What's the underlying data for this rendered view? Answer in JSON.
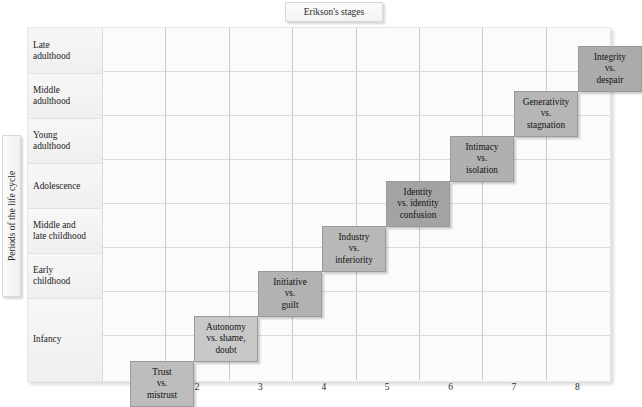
{
  "title": {
    "label": "Erikson's stages"
  },
  "y_axis": {
    "label": "Periods of the life cycle"
  },
  "rows": [
    {
      "id": "late-adulthood",
      "label": "Late\nadulthood",
      "top": 1,
      "height": 45
    },
    {
      "id": "middle-adulthood",
      "label": "Middle\nadulthood",
      "top": 46,
      "height": 45
    },
    {
      "id": "young-adulthood",
      "label": "Young\nadulthood",
      "top": 91,
      "height": 45
    },
    {
      "id": "adolescence",
      "label": "Adolescence",
      "top": 136,
      "height": 45
    },
    {
      "id": "middle-late-childhood",
      "label": "Middle and\nlate childhood",
      "top": 181,
      "height": 45
    },
    {
      "id": "early-childhood",
      "label": "Early\nchildhood",
      "top": 226,
      "height": 45
    },
    {
      "id": "infancy",
      "label": "Infancy",
      "top": 271,
      "height": 81
    }
  ],
  "x_axis": {
    "ticks": [
      "1",
      "2",
      "3",
      "4",
      "5",
      "6",
      "7",
      "8"
    ]
  },
  "chart_data": {
    "type": "heatmap",
    "title": "Erikson's stages",
    "xlabel": "Erikson's stages",
    "ylabel": "Periods of the life cycle",
    "grid": true,
    "legend": "none",
    "categories_x": [
      "1",
      "2",
      "3",
      "4",
      "5",
      "6",
      "7",
      "8"
    ],
    "categories_y": [
      "Infancy",
      "Early childhood",
      "Middle and late childhood",
      "Adolescence",
      "Young adulthood",
      "Middle adulthood",
      "Late adulthood"
    ],
    "cells": [
      {
        "id": "trust-vs-mistrust",
        "stage": 1,
        "period": "Infancy",
        "lines": [
          "Trust",
          "vs.",
          "mistrust"
        ],
        "color": "#bdbdbd",
        "x": 27,
        "y": 333,
        "w": 64,
        "h": 46
      },
      {
        "id": "autonomy-vs-shame-doubt",
        "stage": 2,
        "period": "Infancy",
        "lines": [
          "Autonomy",
          "vs. shame,",
          "doubt"
        ],
        "color": "#c8c8c8",
        "x": 91,
        "y": 288,
        "w": 64,
        "h": 46
      },
      {
        "id": "initiative-vs-guilt",
        "stage": 3,
        "period": "Early childhood",
        "lines": [
          "Initiative",
          "vs.",
          "guilt"
        ],
        "color": "#b2b2b2",
        "x": 155,
        "y": 243,
        "w": 64,
        "h": 46
      },
      {
        "id": "industry-vs-inferiority",
        "stage": 4,
        "period": "Middle and late childhood",
        "lines": [
          "Industry",
          "vs.",
          "inferiority"
        ],
        "color": "#b8b8b8",
        "x": 219,
        "y": 198,
        "w": 64,
        "h": 46
      },
      {
        "id": "identity-vs-identity-confusion",
        "stage": 5,
        "period": "Adolescence",
        "lines": [
          "Identity",
          "vs. identity",
          "confusion"
        ],
        "color": "#a3a3a3",
        "x": 283,
        "y": 153,
        "w": 64,
        "h": 46
      },
      {
        "id": "intimacy-vs-isolation",
        "stage": 6,
        "period": "Young adulthood",
        "lines": [
          "Intimacy",
          "vs.",
          "isolation"
        ],
        "color": "#b0b0b0",
        "x": 347,
        "y": 108,
        "w": 64,
        "h": 46
      },
      {
        "id": "generativity-vs-stagnation",
        "stage": 7,
        "period": "Middle adulthood",
        "lines": [
          "Generativity",
          "vs.",
          "stagnation"
        ],
        "color": "#b6b6b6",
        "x": 411,
        "y": 63,
        "w": 64,
        "h": 46
      },
      {
        "id": "integrity-vs-despair",
        "stage": 8,
        "period": "Late adulthood",
        "lines": [
          "Integrity",
          "vs.",
          "despair"
        ],
        "color": "#ababab",
        "x": 475,
        "y": 18,
        "w": 64,
        "h": 46
      }
    ],
    "colors": {
      "panel_background": "#fdfdfd",
      "cell_background": "#fbfbfb",
      "grid_line": "#c9c9c9",
      "row_label_background": "#f3f3f3",
      "text": "#1a1a1a"
    }
  }
}
